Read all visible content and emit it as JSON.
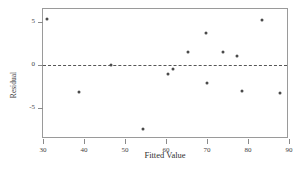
{
  "chart_data": {
    "type": "scatter",
    "title": "",
    "xlabel": "Fitted Value",
    "ylabel": "Residual",
    "xlim": [
      30,
      90
    ],
    "ylim": [
      -8.6,
      6.5
    ],
    "xticks": [
      30,
      40,
      50,
      60,
      70,
      80,
      90
    ],
    "xticklabels": [
      "30",
      "40",
      "50",
      "60",
      "70",
      "80",
      "90"
    ],
    "yticks": [
      5,
      0,
      -5
    ],
    "yticklabels": [
      "5",
      "0",
      "-5"
    ],
    "grid": false,
    "legend": null,
    "reference_line": {
      "orientation": "horizontal",
      "y": 0,
      "style": "dashed"
    },
    "marker": {
      "shape": "circle",
      "color": "#4a4a4a",
      "size": 3
    },
    "x": [
      31.0,
      38.8,
      46.5,
      54.3,
      60.6,
      61.8,
      65.3,
      69.8,
      70.0,
      73.8,
      77.4,
      78.6,
      83.3,
      87.8
    ],
    "y": [
      5.35,
      -3.1,
      0.0,
      -7.4,
      -1.05,
      -0.5,
      1.5,
      3.75,
      -2.05,
      1.45,
      1.0,
      -3.05,
      5.2,
      -3.2
    ],
    "points": [
      {
        "x": 31.0,
        "y": 5.35
      },
      {
        "x": 38.8,
        "y": -3.1
      },
      {
        "x": 46.5,
        "y": 0.0
      },
      {
        "x": 54.3,
        "y": -7.4
      },
      {
        "x": 60.6,
        "y": -1.05
      },
      {
        "x": 61.8,
        "y": -0.5
      },
      {
        "x": 65.3,
        "y": 1.5
      },
      {
        "x": 69.8,
        "y": 3.75
      },
      {
        "x": 70.0,
        "y": -2.05
      },
      {
        "x": 73.8,
        "y": 1.45
      },
      {
        "x": 77.4,
        "y": 1.0
      },
      {
        "x": 78.6,
        "y": -3.05
      },
      {
        "x": 83.3,
        "y": 5.2
      },
      {
        "x": 87.8,
        "y": -3.2
      }
    ]
  },
  "axis_label_x": "Fitted Value",
  "axis_label_y": "Residual"
}
